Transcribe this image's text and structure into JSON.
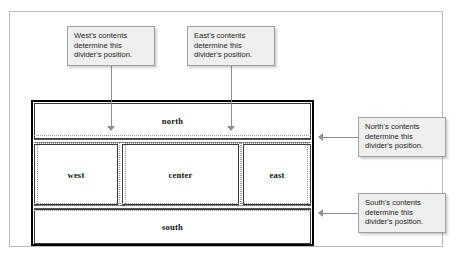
{
  "diagram": {
    "regions": [
      {
        "key": "north",
        "label": "north"
      },
      {
        "key": "west",
        "label": "west"
      },
      {
        "key": "center",
        "label": "center"
      },
      {
        "key": "east",
        "label": "east"
      },
      {
        "key": "south",
        "label": "south"
      }
    ]
  },
  "callouts": [
    {
      "key": "west",
      "text": "West's contents determine this divider's position.",
      "arrow": "down"
    },
    {
      "key": "east",
      "text": "East's contents determine this divider's position.",
      "arrow": "down"
    },
    {
      "key": "north",
      "text": "North's contents determine this divider's position.",
      "arrow": "left"
    },
    {
      "key": "south",
      "text": "South's contents determine this divider's position.",
      "arrow": "left"
    }
  ],
  "colors": {
    "page_background": "#ffffff",
    "outer_frame_border": "#b9b9b9",
    "diagram_border": "#000000",
    "region_border": "#3a3a3a",
    "guide_line": "#9a9a9a",
    "leader_line": "#8e8e8e",
    "callout_background": "#efefef",
    "callout_border": "#9e9e9e",
    "label_text": "#101010",
    "callout_text": "#1c1c1c"
  }
}
